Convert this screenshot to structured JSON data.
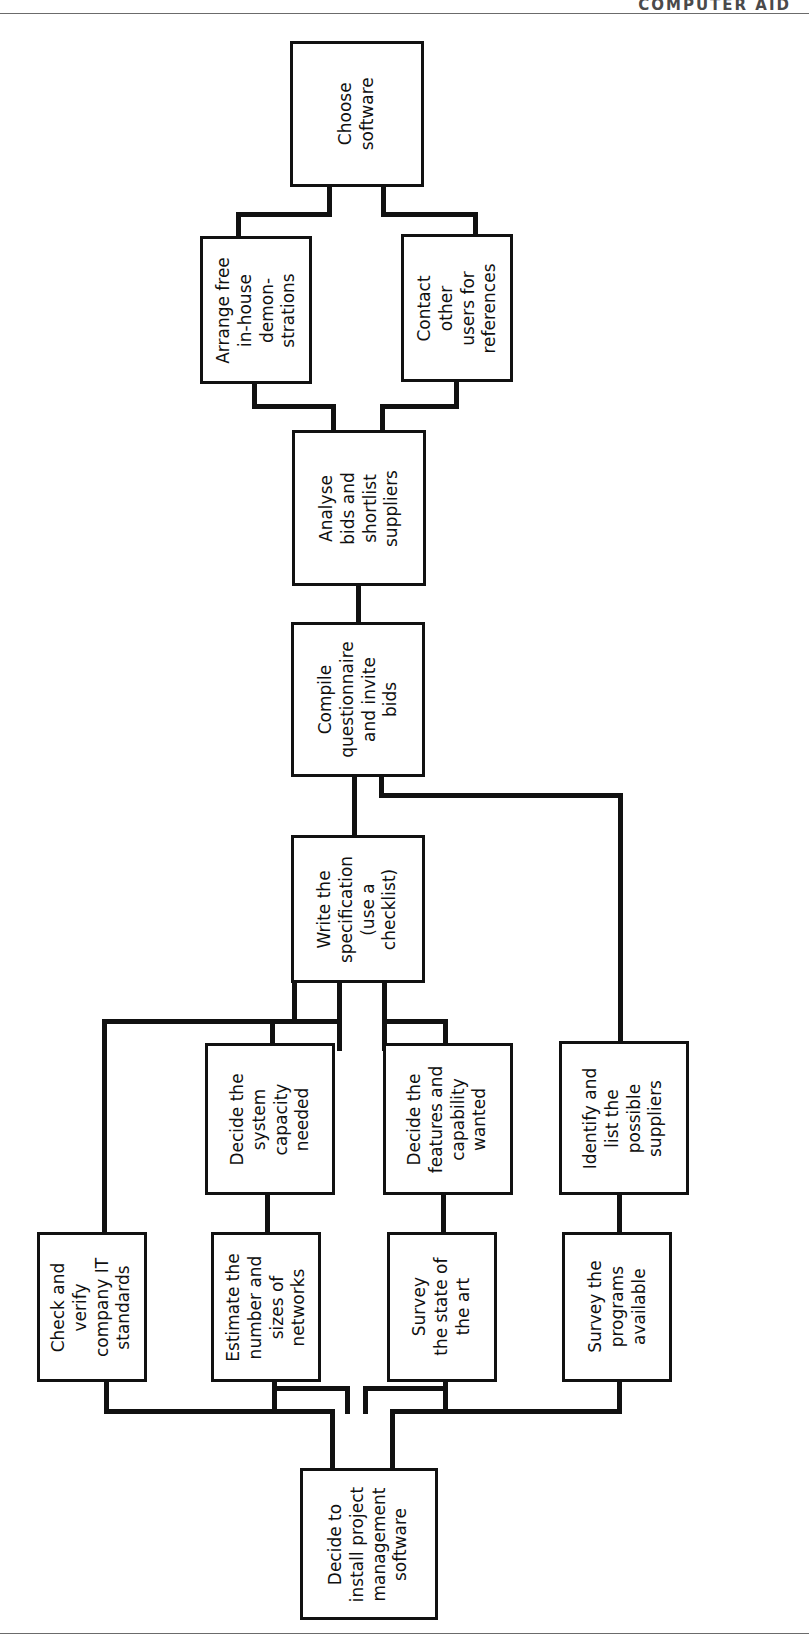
{
  "page": {
    "header": "COMPUTER AID",
    "rules": {
      "top_y": 13,
      "bottom_y": 1633
    }
  },
  "diagram": {
    "orientation": "rotated-90-ccw",
    "line_color": "#111111",
    "background": "#ffffff",
    "nodes": [
      {
        "id": "choose-software",
        "label": "Choose\nsoftware",
        "x": 290,
        "y": 41,
        "w": 134,
        "h": 146
      },
      {
        "id": "arrange-demos",
        "label": "Arrange free\nin-house\ndemon-\nstrations",
        "x": 200,
        "y": 236,
        "w": 112,
        "h": 148
      },
      {
        "id": "contact-users",
        "label": "Contact\nother\nusers for\nreferences",
        "x": 401,
        "y": 234,
        "w": 112,
        "h": 148
      },
      {
        "id": "analyse-bids",
        "label": "Analyse\nbids and\nshortlist\nsuppliers",
        "x": 292,
        "y": 430,
        "w": 134,
        "h": 156
      },
      {
        "id": "compile-questionnaire",
        "label": "Compile\nquestionnaire\nand invite\nbids",
        "x": 291,
        "y": 622,
        "w": 134,
        "h": 155
      },
      {
        "id": "write-specification",
        "label": "Write the\nspecification\n(use a\nchecklist)",
        "x": 291,
        "y": 835,
        "w": 134,
        "h": 148
      },
      {
        "id": "decide-capacity",
        "label": "Decide the\nsystem\ncapacity\nneeded",
        "x": 205,
        "y": 1043,
        "w": 130,
        "h": 152
      },
      {
        "id": "decide-features",
        "label": "Decide the\nfeatures and\ncapability\nwanted",
        "x": 383,
        "y": 1043,
        "w": 130,
        "h": 152
      },
      {
        "id": "identify-suppliers",
        "label": "Identify and\nlist the\npossible\nsuppliers",
        "x": 559,
        "y": 1041,
        "w": 130,
        "h": 154
      },
      {
        "id": "check-standards",
        "label": "Check and\nverify\ncompany IT\nstandards",
        "x": 37,
        "y": 1232,
        "w": 110,
        "h": 150
      },
      {
        "id": "estimate-networks",
        "label": "Estimate the\nnumber and\nsizes of\nnetworks",
        "x": 211,
        "y": 1232,
        "w": 110,
        "h": 150
      },
      {
        "id": "survey-state-of-art",
        "label": "Survey\nthe state of\nthe art",
        "x": 387,
        "y": 1232,
        "w": 110,
        "h": 150
      },
      {
        "id": "survey-programs",
        "label": "Survey the\nprograms\navailable",
        "x": 562,
        "y": 1232,
        "w": 110,
        "h": 150
      },
      {
        "id": "decide-install",
        "label": "Decide to\ninstall project\nmanagement\nsoftware",
        "x": 300,
        "y": 1468,
        "w": 138,
        "h": 152
      }
    ],
    "edges": [
      {
        "from": "arrange-demos",
        "to": "choose-software"
      },
      {
        "from": "contact-users",
        "to": "choose-software"
      },
      {
        "from": "analyse-bids",
        "to": "arrange-demos"
      },
      {
        "from": "analyse-bids",
        "to": "contact-users"
      },
      {
        "from": "compile-questionnaire",
        "to": "analyse-bids"
      },
      {
        "from": "write-specification",
        "to": "compile-questionnaire"
      },
      {
        "from": "identify-suppliers",
        "to": "compile-questionnaire"
      },
      {
        "from": "decide-capacity",
        "to": "write-specification"
      },
      {
        "from": "decide-features",
        "to": "write-specification"
      },
      {
        "from": "check-standards",
        "to": "write-specification"
      },
      {
        "from": "estimate-networks",
        "to": "decide-capacity"
      },
      {
        "from": "survey-state-of-art",
        "to": "decide-features"
      },
      {
        "from": "survey-programs",
        "to": "identify-suppliers"
      },
      {
        "from": "decide-install",
        "to": "check-standards"
      },
      {
        "from": "decide-install",
        "to": "estimate-networks"
      },
      {
        "from": "decide-install",
        "to": "survey-state-of-art"
      },
      {
        "from": "decide-install",
        "to": "survey-programs"
      }
    ],
    "connector_segments": [
      {
        "name": "choose-left-stub",
        "x": 327,
        "y": 186,
        "w": 5,
        "h": 30
      },
      {
        "name": "choose-left-horiz",
        "x": 236,
        "y": 212,
        "w": 96,
        "h": 5
      },
      {
        "name": "arrange-up-stub",
        "x": 236,
        "y": 212,
        "w": 5,
        "h": 27
      },
      {
        "name": "choose-right-stub",
        "x": 381,
        "y": 186,
        "w": 5,
        "h": 30
      },
      {
        "name": "choose-right-horiz",
        "x": 381,
        "y": 212,
        "w": 97,
        "h": 5
      },
      {
        "name": "contact-up-stub",
        "x": 473,
        "y": 212,
        "w": 5,
        "h": 27
      },
      {
        "name": "arrange-down-stub",
        "x": 252,
        "y": 382,
        "w": 5,
        "h": 26
      },
      {
        "name": "arrange-down-horiz",
        "x": 252,
        "y": 404,
        "w": 84,
        "h": 5
      },
      {
        "name": "analyse-up-left",
        "x": 331,
        "y": 404,
        "w": 5,
        "h": 28
      },
      {
        "name": "contact-down-stub",
        "x": 454,
        "y": 382,
        "w": 5,
        "h": 26
      },
      {
        "name": "contact-down-horiz",
        "x": 380,
        "y": 404,
        "w": 79,
        "h": 5
      },
      {
        "name": "analyse-up-right",
        "x": 380,
        "y": 404,
        "w": 5,
        "h": 28
      },
      {
        "name": "analyse-to-compile",
        "x": 356,
        "y": 584,
        "w": 5,
        "h": 40
      },
      {
        "name": "compile-down-left",
        "x": 352,
        "y": 775,
        "w": 5,
        "h": 62
      },
      {
        "name": "compile-down-right",
        "x": 379,
        "y": 775,
        "w": 5,
        "h": 22
      },
      {
        "name": "compile-right-horiz",
        "x": 379,
        "y": 793,
        "w": 243,
        "h": 5
      },
      {
        "name": "identify-up-stub",
        "x": 618,
        "y": 793,
        "w": 5,
        "h": 250
      },
      {
        "name": "spec-down-a",
        "x": 292,
        "y": 981,
        "w": 5,
        "h": 42
      },
      {
        "name": "spec-down-b",
        "x": 337,
        "y": 981,
        "w": 5,
        "h": 70
      },
      {
        "name": "spec-down-c",
        "x": 382,
        "y": 981,
        "w": 5,
        "h": 70
      },
      {
        "name": "spec-left-horiz",
        "x": 102,
        "y": 1019,
        "w": 195,
        "h": 5
      },
      {
        "name": "check-left-vert",
        "x": 102,
        "y": 1019,
        "w": 5,
        "h": 215
      },
      {
        "name": "capacity-horiz",
        "x": 270,
        "y": 1019,
        "w": 72,
        "h": 5
      },
      {
        "name": "capacity-up-stub",
        "x": 270,
        "y": 1019,
        "w": 5,
        "h": 26
      },
      {
        "name": "features-horiz",
        "x": 382,
        "y": 1019,
        "w": 66,
        "h": 5
      },
      {
        "name": "features-up-stub",
        "x": 443,
        "y": 1019,
        "w": 5,
        "h": 26
      },
      {
        "name": "capacity-to-estimate",
        "x": 265,
        "y": 1193,
        "w": 5,
        "h": 41
      },
      {
        "name": "features-to-survey",
        "x": 441,
        "y": 1193,
        "w": 5,
        "h": 41
      },
      {
        "name": "identify-to-survey",
        "x": 617,
        "y": 1193,
        "w": 5,
        "h": 41
      },
      {
        "name": "check-down-stub",
        "x": 104,
        "y": 1380,
        "w": 5,
        "h": 32
      },
      {
        "name": "check-down-horiz",
        "x": 104,
        "y": 1409,
        "w": 230,
        "h": 5
      },
      {
        "name": "estimate-down-stub",
        "x": 272,
        "y": 1380,
        "w": 5,
        "h": 30
      },
      {
        "name": "estimate-down-horiz",
        "x": 272,
        "y": 1386,
        "w": 78,
        "h": 5
      },
      {
        "name": "estimate-mid-vert",
        "x": 345,
        "y": 1386,
        "w": 5,
        "h": 28
      },
      {
        "name": "survey-art-stub",
        "x": 443,
        "y": 1380,
        "w": 5,
        "h": 30
      },
      {
        "name": "survey-art-horiz",
        "x": 363,
        "y": 1386,
        "w": 85,
        "h": 5
      },
      {
        "name": "survey-art-mid-vert",
        "x": 363,
        "y": 1386,
        "w": 5,
        "h": 28
      },
      {
        "name": "survey-prog-stub",
        "x": 617,
        "y": 1380,
        "w": 5,
        "h": 32
      },
      {
        "name": "survey-prog-horiz",
        "x": 390,
        "y": 1409,
        "w": 232,
        "h": 5
      },
      {
        "name": "install-up-left",
        "x": 330,
        "y": 1409,
        "w": 5,
        "h": 62
      },
      {
        "name": "install-up-right",
        "x": 390,
        "y": 1409,
        "w": 5,
        "h": 62
      }
    ]
  }
}
